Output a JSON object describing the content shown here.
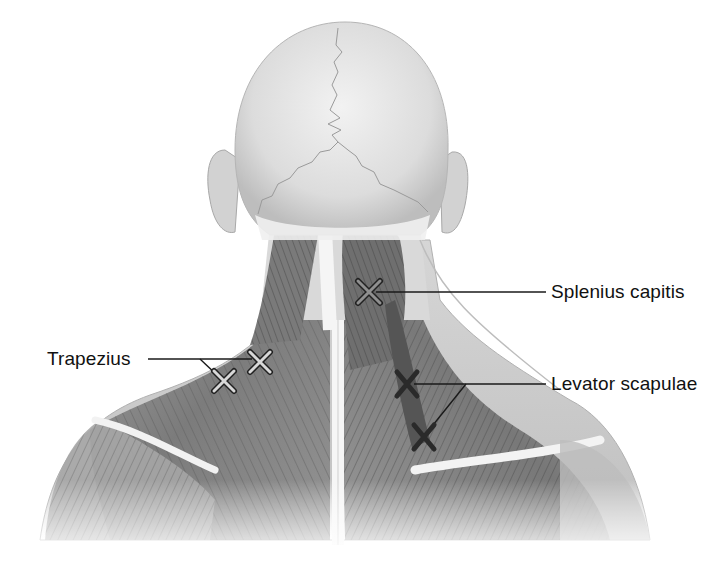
{
  "figure": {
    "colors": {
      "background": "#ffffff",
      "skin_light": "#e9e9e9",
      "skin_mid": "#cfcfcf",
      "muscle_dark": "#5a5a5a",
      "muscle_mid": "#8a8a8a",
      "tendon_white": "#f4f4f4",
      "suture_line": "#9a9a9a",
      "leader_line": "#1a1a1a",
      "marker_light_fill": "#d8d8d8",
      "marker_dark_fill": "#2a2a2a",
      "marker_outline": "#222222"
    }
  },
  "labels": [
    {
      "id": "trapezius",
      "text": "Trapezius",
      "x": 47,
      "y": 348,
      "marker_style": "light",
      "markers": [
        {
          "x": 260,
          "y": 362
        },
        {
          "x": 224,
          "y": 381
        }
      ],
      "leader": {
        "from": [
          148,
          359
        ],
        "junction": [
          200,
          359
        ]
      }
    },
    {
      "id": "splenius-capitis",
      "text": "Splenius capitis",
      "x": 551,
      "y": 281,
      "marker_style": "light",
      "markers": [
        {
          "x": 369,
          "y": 292
        }
      ],
      "leader": {
        "from": [
          546,
          292
        ]
      }
    },
    {
      "id": "levator-scapulae",
      "text": "Levator scapulae",
      "x": 551,
      "y": 373,
      "marker_style": "dark",
      "markers": [
        {
          "x": 407,
          "y": 384
        },
        {
          "x": 424,
          "y": 437
        }
      ],
      "leader": {
        "from": [
          546,
          384
        ],
        "junction": [
          466,
          384
        ]
      }
    }
  ]
}
